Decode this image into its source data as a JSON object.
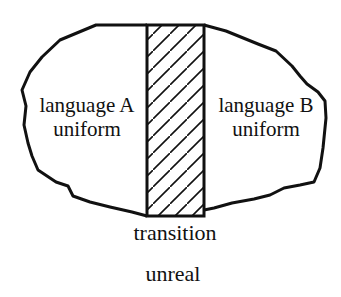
{
  "diagram": {
    "type": "region-diagram",
    "regions": [
      {
        "id": "language-a",
        "lines": [
          "language A",
          "uniform"
        ]
      },
      {
        "id": "transition-zone",
        "fill": "diagonal-hatch"
      },
      {
        "id": "language-b",
        "lines": [
          "language B",
          "uniform"
        ]
      }
    ],
    "labels": {
      "transition": "transition",
      "outside": "unreal"
    },
    "colors": {
      "stroke": "#111111",
      "background": "#ffffff"
    }
  }
}
